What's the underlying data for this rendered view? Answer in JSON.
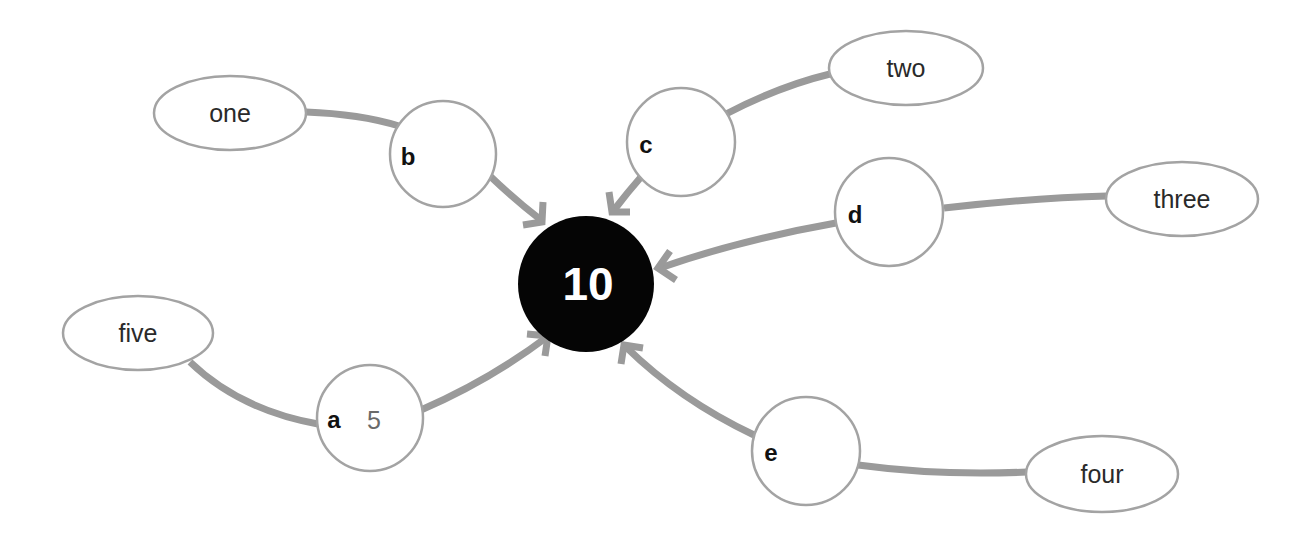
{
  "diagram": {
    "title": "",
    "center": {
      "label": "10",
      "fill": "#050505",
      "text_color": "#ffffff"
    },
    "nodes": [
      {
        "id": "a",
        "letter": "a",
        "value": "5",
        "leaf": "five"
      },
      {
        "id": "b",
        "letter": "b",
        "value": "",
        "leaf": "one"
      },
      {
        "id": "c",
        "letter": "c",
        "value": "",
        "leaf": "two"
      },
      {
        "id": "d",
        "letter": "d",
        "value": "",
        "leaf": "three"
      },
      {
        "id": "e",
        "letter": "e",
        "value": "",
        "leaf": "four"
      }
    ],
    "edges": [
      {
        "from": "five",
        "to": "a",
        "arrow": false
      },
      {
        "from": "a",
        "to": "10",
        "arrow": true
      },
      {
        "from": "one",
        "to": "b",
        "arrow": false
      },
      {
        "from": "b",
        "to": "10",
        "arrow": true
      },
      {
        "from": "two",
        "to": "c",
        "arrow": false
      },
      {
        "from": "c",
        "to": "10",
        "arrow": true
      },
      {
        "from": "three",
        "to": "d",
        "arrow": false
      },
      {
        "from": "d",
        "to": "10",
        "arrow": true
      },
      {
        "from": "four",
        "to": "e",
        "arrow": false
      },
      {
        "from": "e",
        "to": "10",
        "arrow": true
      }
    ],
    "colors": {
      "edge": "#9a9a9a",
      "node_outline": "#a3a3a3",
      "background": "#ffffff"
    }
  }
}
